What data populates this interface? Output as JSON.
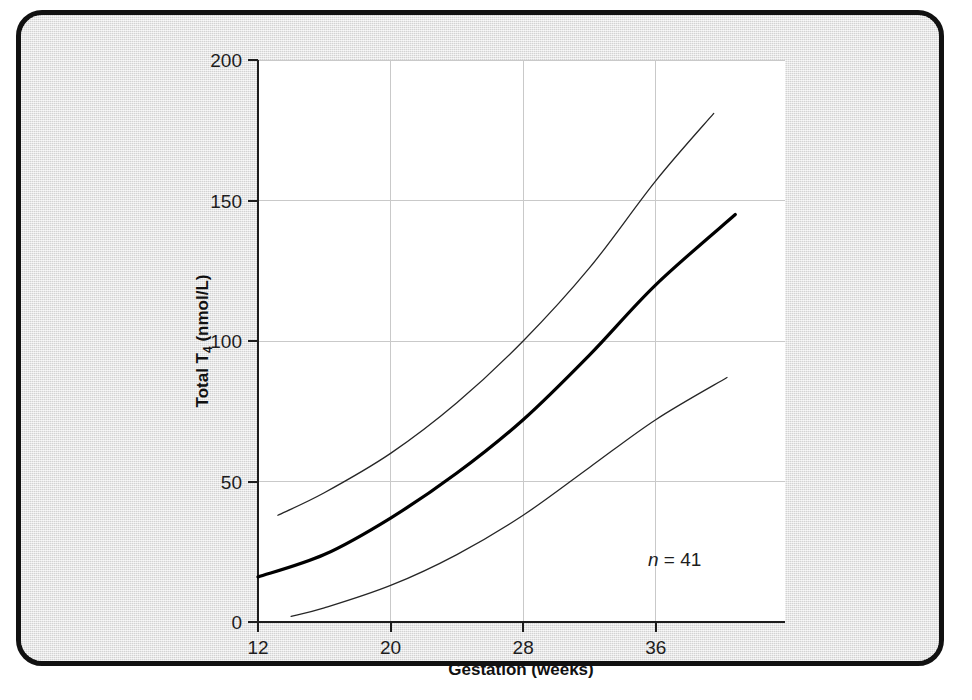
{
  "figure": {
    "background_color": "#e2e2e2",
    "plot_background_color": "#ffffff",
    "frame_color": "#111111"
  },
  "chart_data": {
    "type": "line",
    "title": "",
    "subtitle": "",
    "xlabel": "Gestation (weeks)",
    "ylabel": "Total T4 (nmol/L)",
    "ylabel_main": "Total T",
    "ylabel_subscript": "4",
    "ylabel_units": " (nmol/L)",
    "xlim": [
      12,
      43.8
    ],
    "ylim": [
      0,
      200
    ],
    "xticks": [
      12,
      20,
      28,
      36
    ],
    "xtick_labels": [
      "12",
      "20",
      "28",
      "36"
    ],
    "yticks": [
      0,
      50,
      100,
      150,
      200
    ],
    "ytick_labels": [
      "0",
      "50",
      "100",
      "150",
      "200"
    ],
    "grid": true,
    "grid_color": "#c9c9c9",
    "legend": null,
    "legend_position": "none",
    "annotations": [
      {
        "name": "sample-size",
        "text_italic": "n",
        "text_rest": " = 41",
        "text_full": "n = 41",
        "x": 38.0,
        "y": 24
      }
    ],
    "series": [
      {
        "name": "Upper reference limit (97.5th centile)",
        "style": "thin",
        "line_width": 1.3,
        "color": "#262626",
        "x": [
          13.2,
          16,
          20,
          24,
          28,
          32,
          36,
          39.5
        ],
        "values": [
          38,
          46,
          60,
          78,
          100,
          126,
          157,
          181
        ]
      },
      {
        "name": "Mean (50th centile)",
        "style": "bold",
        "line_width": 3.2,
        "color": "#000000",
        "x": [
          12,
          16,
          20,
          24,
          28,
          32,
          36,
          40.8
        ],
        "values": [
          16,
          24,
          37,
          53,
          72,
          95,
          120,
          145
        ]
      },
      {
        "name": "Lower reference limit (2.5th centile)",
        "style": "thin",
        "line_width": 1.3,
        "color": "#262626",
        "x": [
          14.0,
          16,
          20,
          24,
          28,
          32,
          36,
          40.3
        ],
        "values": [
          2,
          5,
          13,
          24,
          38,
          55,
          72,
          87
        ]
      }
    ]
  }
}
